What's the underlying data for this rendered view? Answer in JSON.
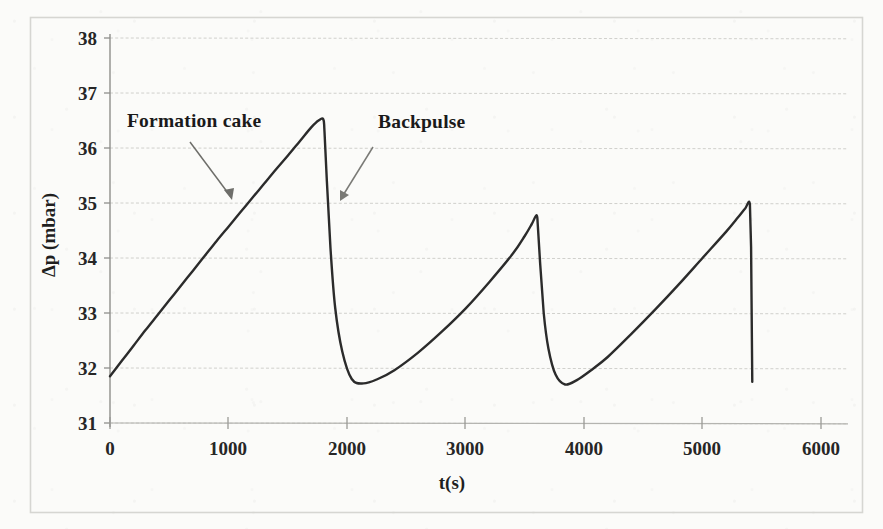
{
  "figure": {
    "background_color": "#fbfbf9",
    "border_color": "#d8d8d4",
    "ink_color": "#2b2b2b",
    "grid_color": "#cfcfcb"
  },
  "chart_data": {
    "type": "line",
    "title": "",
    "xlabel": "t(s)",
    "ylabel": "Δp (mbar)",
    "xlim": [
      0,
      6000
    ],
    "ylim": [
      31,
      38
    ],
    "xticks": [
      0,
      1000,
      2000,
      3000,
      4000,
      5000,
      6000
    ],
    "xticklabels": [
      "0",
      "1000",
      "2000",
      "3000",
      "4000",
      "5000",
      "6000"
    ],
    "yticks": [
      31,
      32,
      33,
      34,
      35,
      36,
      37,
      38
    ],
    "yticklabels": [
      "31",
      "32",
      "33",
      "34",
      "35",
      "36",
      "37",
      "38"
    ],
    "grid": true,
    "grid_axis": "y",
    "legend": false,
    "legend_position": "none",
    "series": [
      {
        "name": "Transmembrane pressure",
        "line_color": "#2b2b2b",
        "line_width": 2.4,
        "x": [
          0,
          100,
          200,
          300,
          400,
          500,
          600,
          700,
          800,
          900,
          1000,
          1100,
          1200,
          1300,
          1400,
          1500,
          1600,
          1700,
          1760,
          1800,
          1810,
          1830,
          1860,
          1900,
          1960,
          2040,
          2140,
          2260,
          2400,
          2600,
          2800,
          3000,
          3200,
          3400,
          3500,
          3560,
          3600,
          3610,
          3630,
          3660,
          3700,
          3760,
          3840,
          3940,
          4060,
          4200,
          4400,
          4600,
          4800,
          5000,
          5200,
          5300,
          5360,
          5400,
          5410,
          5420
        ],
        "y": [
          31.85,
          32.13,
          32.41,
          32.69,
          32.96,
          33.23,
          33.5,
          33.77,
          34.04,
          34.31,
          34.57,
          34.83,
          35.09,
          35.35,
          35.61,
          35.86,
          36.12,
          36.38,
          36.5,
          36.52,
          36.3,
          35.4,
          34.2,
          33.1,
          32.3,
          31.8,
          31.72,
          31.8,
          31.96,
          32.28,
          32.66,
          33.08,
          33.56,
          34.08,
          34.4,
          34.62,
          34.78,
          34.6,
          33.9,
          33.0,
          32.35,
          31.88,
          31.7,
          31.78,
          31.96,
          32.2,
          32.62,
          33.06,
          33.52,
          34.0,
          34.48,
          34.74,
          34.9,
          34.98,
          34.2,
          31.75
        ]
      }
    ],
    "cycles": [
      {
        "index": 1,
        "start_s": 0,
        "peak_s": 1800,
        "peak_value": 36.52,
        "trough_value": 31.72
      },
      {
        "index": 2,
        "start_s": 1800,
        "peak_s": 3600,
        "peak_value": 36.5,
        "trough_value": 31.7
      },
      {
        "index": 3,
        "start_s": 3600,
        "peak_s": 5400,
        "peak_value": 36.47,
        "trough_value": 31.75
      }
    ],
    "annotations": [
      {
        "id": "formation-cake",
        "text": "Formation cake",
        "text_x": 1010,
        "text_y": 36.95,
        "arrow_from_x": 1070,
        "arrow_from_y": 36.3,
        "arrow_to_x": 1260,
        "arrow_to_y": 35.08
      },
      {
        "id": "backpulse",
        "text": "Backpulse",
        "text_x": 2300,
        "text_y": 36.92,
        "arrow_from_x": 2160,
        "arrow_from_y": 36.08,
        "arrow_to_x": 1955,
        "arrow_to_y": 35.08
      }
    ]
  }
}
